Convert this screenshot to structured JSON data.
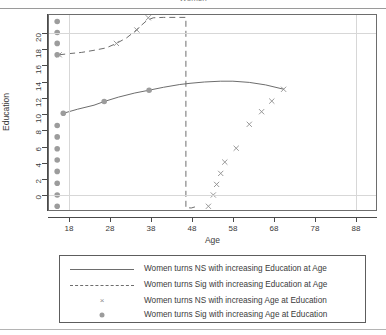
{
  "title": {
    "text": "Women",
    "visible_partial": true
  },
  "axes": {
    "xlabel": "Age",
    "ylabel": "Education",
    "xticks": [
      18,
      28,
      38,
      48,
      58,
      68,
      78,
      88
    ],
    "yticks": [
      0,
      2,
      4,
      6,
      8,
      10,
      12,
      14,
      16,
      18,
      20
    ],
    "xlim": [
      13,
      93
    ],
    "ylim": [
      -1.8,
      22.2
    ],
    "grid_x": [
      18,
      88
    ],
    "grid_y": [
      0,
      20
    ]
  },
  "colors": {
    "line": "#6d6d6d",
    "marker_x": "#8d8d8d",
    "marker_dot": "#9c9c9c",
    "axis": "#4a4a4a",
    "grid": "#d7d7d7",
    "box": "#6d6d6d",
    "text": "#3b3b3b",
    "background": "#ffffff"
  },
  "legend": {
    "items": [
      {
        "key": "solid-line",
        "label": "Women turns NS with increasing Education at Age"
      },
      {
        "key": "dashed-line",
        "label": "Women turns Sig with increasing Education at Age"
      },
      {
        "key": "x-marker",
        "label": "Women turns NS with increasing Age at Education"
      },
      {
        "key": "dot-marker",
        "label": "Women turns Sig with increasing Age at Education"
      }
    ]
  },
  "chart_data": {
    "type": "line",
    "title": "Women",
    "xlabel": "Age",
    "ylabel": "Education",
    "xlim": [
      13,
      93
    ],
    "ylim": [
      -1.8,
      22.2
    ],
    "xticks": [
      18,
      28,
      38,
      48,
      58,
      68,
      78,
      88
    ],
    "yticks": [
      0,
      2,
      4,
      6,
      8,
      10,
      12,
      14,
      16,
      18,
      20
    ],
    "grid": true,
    "legend_position": "below",
    "series": [
      {
        "name": "Women turns NS with increasing Education at Age",
        "style": "solid-line",
        "color": "#6d6d6d",
        "x": [
          16.5,
          20,
          24,
          26.5,
          30,
          34,
          37.5,
          41,
          45,
          47.5,
          51,
          55,
          58,
          62,
          66,
          70.5
        ],
        "y": [
          10.1,
          10.6,
          11.1,
          11.55,
          12.1,
          12.6,
          12.95,
          13.3,
          13.65,
          13.8,
          13.95,
          14.05,
          14.05,
          13.9,
          13.6,
          13.05
        ]
      },
      {
        "name": "Women turns Sig with increasing Education at Age",
        "style": "dashed-line",
        "color": "#6d6d6d",
        "x": [
          15.5,
          18,
          21,
          24,
          27,
          29.5,
          32,
          34,
          35.5,
          37,
          38.5,
          41,
          45,
          46.5,
          46.5,
          46.5,
          46.5,
          46.5,
          46.5,
          47.8,
          49.2
        ],
        "y": [
          17.3,
          17.45,
          17.6,
          17.85,
          18.15,
          18.7,
          19.4,
          20.2,
          20.9,
          21.55,
          21.85,
          21.9,
          21.9,
          21.9,
          18,
          12,
          6,
          0,
          -1.5,
          -1.55,
          -1.35
        ]
      },
      {
        "name": "Women turns NS with increasing Age at Education",
        "style": "x-markers",
        "color": "#8d8d8d",
        "points": [
          {
            "x": 15.5,
            "y": 17.3
          },
          {
            "x": 29.5,
            "y": 18.7
          },
          {
            "x": 34.5,
            "y": 20.35
          },
          {
            "x": 37.3,
            "y": 21.85
          },
          {
            "x": 70.4,
            "y": 13.05
          },
          {
            "x": 67.5,
            "y": 11.6
          },
          {
            "x": 65.0,
            "y": 10.3
          },
          {
            "x": 62.0,
            "y": 8.75
          },
          {
            "x": 58.8,
            "y": 5.8
          },
          {
            "x": 56.0,
            "y": 4.1
          },
          {
            "x": 55.0,
            "y": 2.7
          },
          {
            "x": 54.0,
            "y": 1.35
          },
          {
            "x": 53.2,
            "y": 0.05
          },
          {
            "x": 52.0,
            "y": -1.35
          }
        ]
      },
      {
        "name": "Women turns Sig with increasing Age at Education",
        "style": "dot-markers",
        "color": "#9c9c9c",
        "points": [
          {
            "x": 15.0,
            "y": 21.4
          },
          {
            "x": 15.0,
            "y": 20.05
          },
          {
            "x": 15.0,
            "y": 18.7
          },
          {
            "x": 15.0,
            "y": 17.3
          },
          {
            "x": 15.0,
            "y": 8.6
          },
          {
            "x": 15.0,
            "y": 7.2
          },
          {
            "x": 15.0,
            "y": 5.75
          },
          {
            "x": 15.0,
            "y": 4.35
          },
          {
            "x": 15.0,
            "y": 2.95
          },
          {
            "x": 15.0,
            "y": 1.5
          },
          {
            "x": 15.0,
            "y": 0.05
          },
          {
            "x": 15.0,
            "y": -1.35
          },
          {
            "x": 16.5,
            "y": 10.1
          },
          {
            "x": 26.5,
            "y": 11.55
          },
          {
            "x": 37.5,
            "y": 12.95
          }
        ]
      }
    ]
  }
}
